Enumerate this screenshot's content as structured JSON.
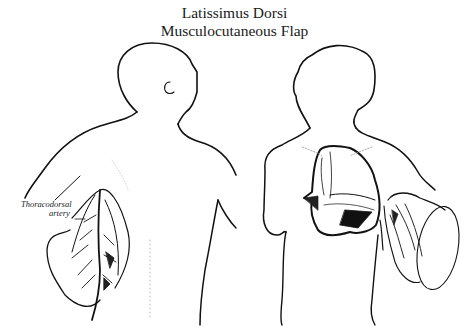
{
  "figure": {
    "title_line1": "Latissimus Dorsi",
    "title_line2": "Musculocutaneous Flap",
    "labels": {
      "vessel_line1": "Thoracodorsal",
      "vessel_line2": "artery"
    },
    "panels": [
      {
        "name": "back-view",
        "description": "Posterior view of torso with latissimus dorsi flap raised showing thoracodorsal artery"
      },
      {
        "name": "front-view",
        "description": "Anterior view of torso with flap tunneled to chest wall defect"
      }
    ],
    "colors": {
      "ink": "#111111",
      "background": "#ffffff",
      "faint": "#9a9a9a"
    }
  }
}
